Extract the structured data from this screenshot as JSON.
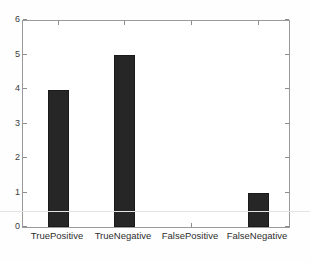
{
  "chart_data": {
    "type": "bar",
    "title": "",
    "xlabel": "",
    "ylabel": "",
    "categories": [
      "TruePositive",
      "TrueNegative",
      "FalsePositive",
      "FalseNegative"
    ],
    "values": [
      4,
      5,
      0,
      1
    ],
    "ylim": [
      0,
      6
    ],
    "yticks": [
      0,
      1,
      2,
      3,
      4,
      5,
      6
    ],
    "ytick_labels": [
      "0",
      "1",
      "2",
      "3",
      "4",
      "5",
      "6"
    ],
    "grid": false,
    "legend": null,
    "bar_color": "#262626",
    "axis_color": "#9a9a9a",
    "background_color": "#ffffff"
  },
  "axis": {
    "y": {
      "labels": [
        "0",
        "1",
        "2",
        "3",
        "4",
        "5",
        "6"
      ]
    },
    "x": {
      "labels": [
        "TruePositive",
        "TrueNegative",
        "FalsePositive",
        "FalseNegative"
      ]
    }
  }
}
